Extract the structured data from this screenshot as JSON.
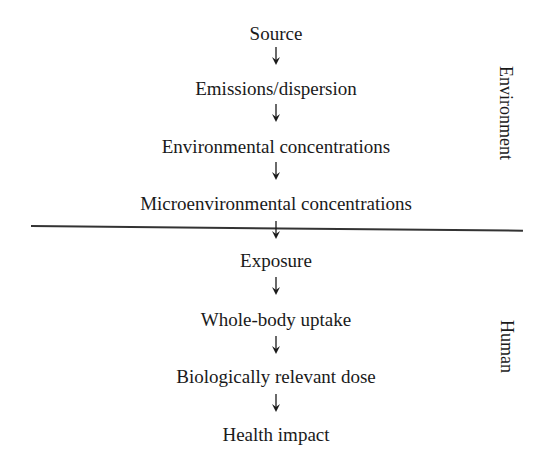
{
  "diagram": {
    "steps": [
      {
        "label": "Source"
      },
      {
        "label": "Emissions/dispersion"
      },
      {
        "label": "Environmental concentrations"
      },
      {
        "label": "Microenvironmental concentrations"
      },
      {
        "label": "Exposure"
      },
      {
        "label": "Whole-body uptake"
      },
      {
        "label": "Biologically relevant dose"
      },
      {
        "label": "Health impact"
      }
    ],
    "sections": {
      "top": "Environment",
      "bottom": "Human"
    },
    "arrow_icon": "down-arrow-icon",
    "colors": {
      "text": "#1a1a1a",
      "line": "#333333",
      "background": "#ffffff"
    }
  }
}
